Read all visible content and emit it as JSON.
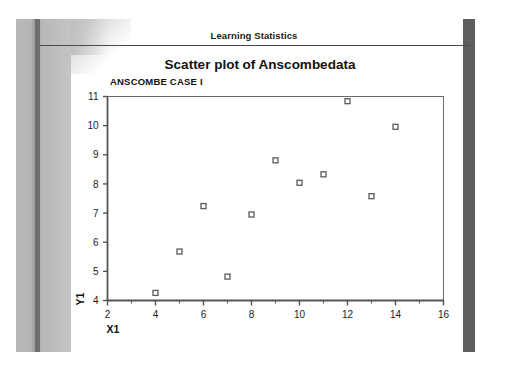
{
  "document": {
    "title": "Learning Statistics"
  },
  "chart_header": {
    "title": "Scatter plot of  Anscombedata",
    "case_label": "ANSCOMBE CASE I"
  },
  "colors": {
    "text": "#111111",
    "axis": "#555555",
    "frame": "#6a6a6a",
    "marker_stroke": "#5a5a5a",
    "left_band": "#bcbcbc",
    "left_stripe": "#6f6f6f",
    "right_bar": "#5d5d5d",
    "rule": "#4a4a4a"
  },
  "chart_data": {
    "type": "scatter",
    "title": "Scatter plot of  Anscombedata",
    "subtitle": "ANSCOMBE CASE I",
    "xlabel": "X1",
    "ylabel": "Y1",
    "xlim": [
      2,
      16
    ],
    "ylim": [
      4,
      11
    ],
    "xticks": [
      2,
      4,
      6,
      8,
      10,
      12,
      14,
      16
    ],
    "yticks": [
      4,
      5,
      6,
      7,
      8,
      9,
      10,
      11
    ],
    "xtick_labels": [
      "2",
      "4",
      "6",
      "8",
      "10",
      "12",
      "14",
      "16"
    ],
    "ytick_labels": [
      "4",
      "5",
      "6",
      "7",
      "8",
      "9",
      "10",
      "11"
    ],
    "x_minor_step": 1,
    "grid": false,
    "legend": false,
    "marker": "open-square",
    "series": [
      {
        "name": "Anscombe I",
        "points": [
          {
            "x": 10.0,
            "y": 8.04
          },
          {
            "x": 8.0,
            "y": 6.95
          },
          {
            "x": 13.0,
            "y": 7.58
          },
          {
            "x": 9.0,
            "y": 8.81
          },
          {
            "x": 11.0,
            "y": 8.33
          },
          {
            "x": 14.0,
            "y": 9.96
          },
          {
            "x": 6.0,
            "y": 7.24
          },
          {
            "x": 4.0,
            "y": 4.26
          },
          {
            "x": 12.0,
            "y": 10.84
          },
          {
            "x": 7.0,
            "y": 4.82
          },
          {
            "x": 5.0,
            "y": 5.68
          }
        ]
      }
    ]
  }
}
